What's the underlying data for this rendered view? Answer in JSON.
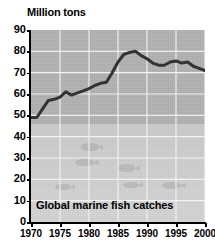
{
  "chart_data": {
    "type": "line",
    "title": "Million tons",
    "caption": "Global marine fish catches",
    "xlabel": "",
    "ylabel": "Million tons",
    "xlim": [
      1970,
      2000
    ],
    "ylim": [
      0,
      90
    ],
    "grid": true,
    "legend": "none",
    "line_color": "#333333",
    "plot_background": "#b3b3b3",
    "gridline_color": "#f2f2f2",
    "y_ticks": [
      0,
      10,
      20,
      30,
      40,
      50,
      60,
      70,
      80,
      90
    ],
    "x_ticks": [
      1970,
      1975,
      1980,
      1985,
      1990,
      1995,
      2000
    ],
    "x": [
      1970,
      1971,
      1972,
      1973,
      1974,
      1975,
      1976,
      1977,
      1978,
      1979,
      1980,
      1981,
      1982,
      1983,
      1984,
      1985,
      1986,
      1987,
      1988,
      1989,
      1990,
      1991,
      1992,
      1993,
      1994,
      1995,
      1996,
      1997,
      1998,
      1999,
      2000
    ],
    "values": [
      49,
      49,
      53,
      57,
      57.5,
      58.5,
      61,
      59.5,
      60.5,
      61.5,
      62.5,
      64,
      65,
      65.5,
      70,
      75,
      78.5,
      79.5,
      80,
      78,
      76.5,
      74.5,
      73.5,
      73.5,
      75,
      75.5,
      74.5,
      75,
      73,
      72,
      71
    ],
    "annotations": [
      {
        "text": "Global marine fish catches",
        "position": "bottom-left-inside-plot"
      }
    ],
    "background_motifs": [
      {
        "name": "fish-watermark",
        "x_pct": 16,
        "y_pct": 82
      },
      {
        "name": "fish-watermark",
        "x_pct": 27,
        "y_pct": 69
      },
      {
        "name": "fish-watermark",
        "x_pct": 30,
        "y_pct": 61
      },
      {
        "name": "fish-watermark",
        "x_pct": 51,
        "y_pct": 72
      },
      {
        "name": "fish-watermark",
        "x_pct": 54,
        "y_pct": 81
      },
      {
        "name": "fish-watermark",
        "x_pct": 76,
        "y_pct": 81
      }
    ]
  }
}
